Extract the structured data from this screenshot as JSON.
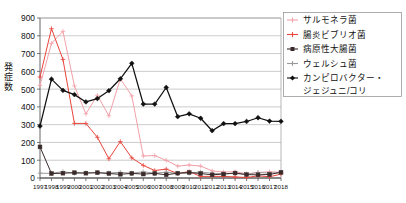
{
  "chart_data": {
    "type": "line",
    "title": "",
    "xlabel": "",
    "ylabel": "発症数",
    "ylim": [
      0,
      900
    ],
    "ytick_step": 100,
    "grid": true,
    "legend_position": "right",
    "x": [
      "1997",
      "1998",
      "1999",
      "2000",
      "2001",
      "2002",
      "2003",
      "2004",
      "2005",
      "2006",
      "2007",
      "2008",
      "2009",
      "2010",
      "2011",
      "2012",
      "2013",
      "2014",
      "2015",
      "2016",
      "2017",
      "2018"
    ],
    "yticks": [
      "0",
      "100",
      "200",
      "300",
      "400",
      "500",
      "600",
      "700",
      "800",
      "900"
    ],
    "series": [
      {
        "name": "サルモネラ菌",
        "color": "#f2a0a8",
        "marker": "cross",
        "values": [
          521,
          757,
          825,
          518,
          361,
          465,
          350,
          558,
          462,
          124,
          126,
          99,
          67,
          73,
          67,
          40,
          34,
          35,
          24,
          31,
          35,
          32
        ]
      },
      {
        "name": "腸炎ビブリオ菌",
        "color": "#e8453c",
        "marker": "cross",
        "values": [
          568,
          840,
          667,
          307,
          307,
          229,
          108,
          205,
          113,
          71,
          42,
          50,
          25,
          36,
          9,
          9,
          9,
          6,
          3,
          12,
          7,
          22
        ]
      },
      {
        "name": "病原性大腸菌",
        "color": "#3a2a2a",
        "marker": "square",
        "values": [
          175,
          25,
          27,
          30,
          27,
          30,
          25,
          21,
          26,
          22,
          26,
          18,
          27,
          31,
          25,
          18,
          22,
          28,
          19,
          18,
          20,
          32
        ]
      },
      {
        "name": "ウェルシュ菌",
        "color": "#9a9a9a",
        "marker": "cross",
        "values": [
          27,
          26,
          36,
          26,
          30,
          30,
          28,
          32,
          27,
          35,
          27,
          33,
          26,
          27,
          34,
          26,
          25,
          25,
          21,
          31,
          27,
          32
        ]
      },
      {
        "name": "カンピロバクター・ジェジュニ/コリ",
        "color": "#111111",
        "marker": "diamond",
        "values": [
          292,
          556,
          493,
          469,
          428,
          447,
          491,
          558,
          645,
          416,
          416,
          509,
          345,
          361,
          336,
          266,
          306,
          306,
          318,
          339,
          320,
          319
        ]
      }
    ],
    "legend": [
      {
        "label": "サルモネラ菌",
        "color": "#f2a0a8"
      },
      {
        "label": "腸炎ビブリオ菌",
        "color": "#e8453c"
      },
      {
        "label": "病原性大腸菌",
        "color": "#3a2a2a"
      },
      {
        "label": "ウェルシュ菌",
        "color": "#9a9a9a"
      },
      {
        "label": "カンピロバクター・",
        "label2": "ジェジュニ/コリ",
        "color": "#111111"
      }
    ]
  }
}
